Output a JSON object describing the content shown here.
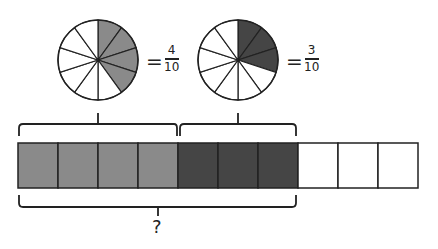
{
  "pies": [
    {
      "id": "pie1",
      "numerator": "4",
      "denominator": "10",
      "equals": "=",
      "shaded": 4,
      "slices": 10,
      "color": "#8a8a8a"
    },
    {
      "id": "pie2",
      "numerator": "3",
      "denominator": "10",
      "equals": "=",
      "shaded": 3,
      "slices": 10,
      "color": "#454545"
    }
  ],
  "bar": {
    "cells": 10,
    "segments": [
      {
        "count": 4,
        "color": "#8a8a8a"
      },
      {
        "count": 3,
        "color": "#454545"
      },
      {
        "count": 3,
        "color": "#ffffff"
      }
    ]
  },
  "question_label": "?"
}
